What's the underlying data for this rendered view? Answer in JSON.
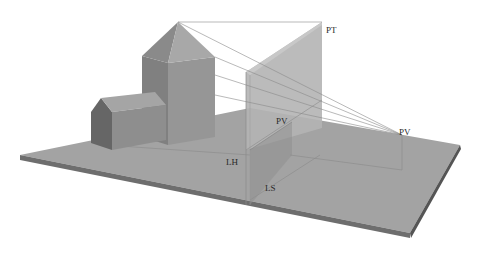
{
  "diagram": {
    "type": "perspective-projection-illustration",
    "labels": {
      "pt": "PT",
      "pv_plane": "PV",
      "pv_eye": "PV",
      "lh": "LH",
      "ls": "LS"
    },
    "colors": {
      "background": "#ffffff",
      "ground_top": "#a3a3a3",
      "ground_edge": "#6e6e6e",
      "picture_plane": "#b4b4b4",
      "tower_front": "#8f8f8f",
      "tower_side": "#9c9c9c",
      "house_front": "#6a6a6a",
      "house_side": "#909090",
      "sight_line": "#8a8a8a"
    }
  }
}
